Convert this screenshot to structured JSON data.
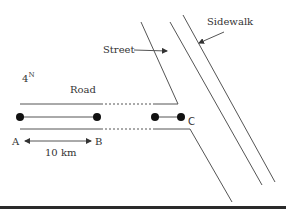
{
  "diagram": {
    "labels": {
      "north": "4",
      "north_sup": "N",
      "road": "Road",
      "street": "Street",
      "sidewalk": "Sidewalk",
      "point_a": "A",
      "point_b": "B",
      "point_c": "C",
      "distance": "10 km"
    },
    "colors": {
      "line": "#555555",
      "node": "#111111",
      "bar": "#2a2a2a"
    }
  }
}
